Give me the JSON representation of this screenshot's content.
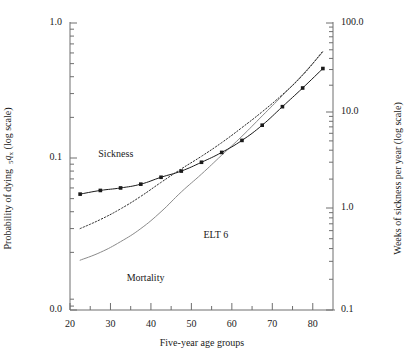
{
  "chart_data": {
    "type": "line",
    "title": "",
    "xlabel": "Five-year age groups",
    "ylabel_left": "Probability of dying  ₅qₓ (log scale)",
    "ylabel_right": "Weeks of sickness per year (log scale)",
    "xlim": [
      20,
      85
    ],
    "xticks_major": [
      20,
      30,
      40,
      50,
      60,
      70,
      80
    ],
    "xticks_minor": [
      25,
      35,
      45,
      55,
      65,
      75
    ],
    "xtick_labels": [
      "20",
      "30",
      "40",
      "50",
      "60",
      "70",
      "80"
    ],
    "left_axis": {
      "scale": "log",
      "ticks": [
        1.0,
        0.1,
        0.0
      ],
      "tick_labels": [
        "1.0",
        "0.1",
        "0.0"
      ],
      "minor_count_per_decade": 8
    },
    "right_axis": {
      "scale": "log",
      "ticks": [
        100.0,
        10.0,
        1.0,
        0.1
      ],
      "tick_labels": [
        "100.0",
        "10.0",
        "1.0",
        "0.1"
      ],
      "minor_count_per_decade": 8
    },
    "grid": false,
    "legend_position": "inline-annotations",
    "annotations": [
      {
        "text": "Sickness",
        "x": 27,
        "y": 0.105
      },
      {
        "text": "ELT 6",
        "x": 53,
        "y": 0.0265
      },
      {
        "text": "Mortality",
        "x": 34,
        "y": 0.0128
      }
    ],
    "series": [
      {
        "name": "Sickness",
        "style": "solid-with-markers",
        "marker": "square",
        "x": [
          22.5,
          27.5,
          32.5,
          37.5,
          42.5,
          47.5,
          52.5,
          57.5,
          62.5,
          67.5,
          72.5,
          77.5,
          82.5
        ],
        "values": [
          0.054,
          0.0575,
          0.06,
          0.064,
          0.072,
          0.08,
          0.093,
          0.11,
          0.135,
          0.175,
          0.24,
          0.33,
          0.46
        ]
      },
      {
        "name": "ELT 6",
        "style": "dotted",
        "marker": "none",
        "x": [
          22.5,
          27.5,
          32.5,
          37.5,
          42.5,
          47.5,
          52.5,
          57.5,
          62.5,
          67.5,
          72.5,
          77.5,
          82.5
        ],
        "values": [
          0.03,
          0.035,
          0.042,
          0.052,
          0.066,
          0.083,
          0.103,
          0.13,
          0.168,
          0.22,
          0.295,
          0.41,
          0.62
        ]
      },
      {
        "name": "Mortality",
        "style": "thin-solid",
        "marker": "none",
        "x": [
          22.5,
          27.5,
          32.5,
          37.5,
          42.5,
          47.5,
          52.5,
          57.5,
          62.5,
          67.5,
          72.5,
          77.5,
          82.5
        ],
        "values": [
          0.0175,
          0.02,
          0.024,
          0.03,
          0.04,
          0.056,
          0.076,
          0.105,
          0.145,
          0.205,
          0.29,
          0.415,
          0.61
        ]
      }
    ]
  },
  "colors": {
    "axis": "#6e6e6e",
    "text": "#1a1a1a",
    "sickness": "#1a1a1a",
    "elt6": "#2b2b2b",
    "mortality": "#8a8a8a"
  }
}
